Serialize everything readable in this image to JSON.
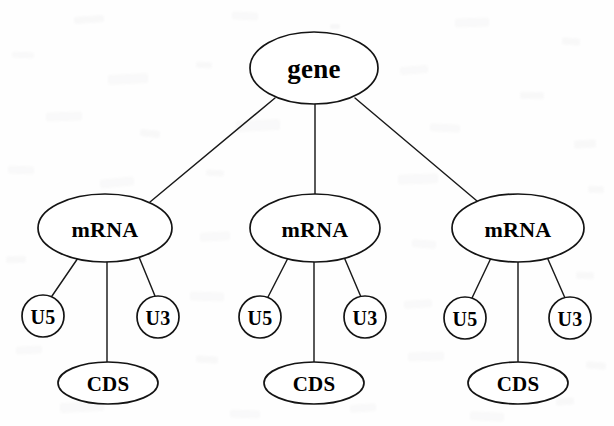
{
  "diagram": {
    "type": "tree",
    "background_color": "#fefefe",
    "stroke_color": "#141414",
    "text_color": "#000000",
    "root": {
      "id": "gene",
      "label": "gene",
      "shape": "ellipse",
      "cx": 314,
      "cy": 68,
      "rx": 64,
      "ry": 36
    },
    "nodes": [
      {
        "id": "mrna-1",
        "label": "mRNA",
        "shape": "ellipse",
        "cx": 105,
        "cy": 228,
        "rx": 67,
        "ry": 34
      },
      {
        "id": "u5-1",
        "label": "U5",
        "shape": "circle",
        "cx": 43,
        "cy": 316,
        "rx": 21,
        "ry": 21
      },
      {
        "id": "u3-1",
        "label": "U3",
        "shape": "circle",
        "cx": 158,
        "cy": 317,
        "rx": 21,
        "ry": 21
      },
      {
        "id": "cds-1",
        "label": "CDS",
        "shape": "ellipse",
        "cx": 108,
        "cy": 383,
        "rx": 50,
        "ry": 21
      },
      {
        "id": "mrna-2",
        "label": "mRNA",
        "shape": "ellipse",
        "cx": 315,
        "cy": 228,
        "rx": 65,
        "ry": 34
      },
      {
        "id": "u5-2",
        "label": "U5",
        "shape": "circle",
        "cx": 260,
        "cy": 317,
        "rx": 21,
        "ry": 21
      },
      {
        "id": "u3-2",
        "label": "U3",
        "shape": "circle",
        "cx": 365,
        "cy": 317,
        "rx": 21,
        "ry": 21
      },
      {
        "id": "cds-2",
        "label": "CDS",
        "shape": "ellipse",
        "cx": 314,
        "cy": 383,
        "rx": 50,
        "ry": 21
      },
      {
        "id": "mrna-3",
        "label": "mRNA",
        "shape": "ellipse",
        "cx": 518,
        "cy": 228,
        "rx": 66,
        "ry": 34
      },
      {
        "id": "u5-3",
        "label": "U5",
        "shape": "circle",
        "cx": 465,
        "cy": 318,
        "rx": 21,
        "ry": 21
      },
      {
        "id": "u3-3",
        "label": "U3",
        "shape": "circle",
        "cx": 570,
        "cy": 318,
        "rx": 21,
        "ry": 21
      },
      {
        "id": "cds-3",
        "label": "CDS",
        "shape": "ellipse",
        "cx": 518,
        "cy": 383,
        "rx": 50,
        "ry": 21
      }
    ],
    "edges": [
      {
        "id": "edge-gene-mrna-1",
        "from": "gene",
        "to": "mrna-1",
        "x1": 275,
        "y1": 98,
        "x2": 150,
        "y2": 202
      },
      {
        "id": "edge-gene-mrna-2",
        "from": "gene",
        "to": "mrna-2",
        "x1": 315,
        "y1": 104,
        "x2": 315,
        "y2": 194
      },
      {
        "id": "edge-gene-mrna-3",
        "from": "gene",
        "to": "mrna-3",
        "x1": 355,
        "y1": 98,
        "x2": 477,
        "y2": 201
      },
      {
        "id": "edge-mrna-1-u5",
        "from": "mrna-1",
        "to": "u5-1",
        "x1": 78,
        "y1": 258,
        "x2": 52,
        "y2": 296
      },
      {
        "id": "edge-mrna-1-cds",
        "from": "mrna-1",
        "to": "cds-1",
        "x1": 107,
        "y1": 262,
        "x2": 107,
        "y2": 362
      },
      {
        "id": "edge-mrna-1-u3",
        "from": "mrna-1",
        "to": "u3-1",
        "x1": 139,
        "y1": 257,
        "x2": 155,
        "y2": 296
      },
      {
        "id": "edge-mrna-2-u5",
        "from": "mrna-2",
        "to": "u5-2",
        "x1": 288,
        "y1": 258,
        "x2": 268,
        "y2": 297
      },
      {
        "id": "edge-mrna-2-cds",
        "from": "mrna-2",
        "to": "cds-2",
        "x1": 314,
        "y1": 262,
        "x2": 314,
        "y2": 362
      },
      {
        "id": "edge-mrna-2-u3",
        "from": "mrna-2",
        "to": "u3-2",
        "x1": 344,
        "y1": 257,
        "x2": 361,
        "y2": 297
      },
      {
        "id": "edge-mrna-3-u5",
        "from": "mrna-3",
        "to": "u5-3",
        "x1": 491,
        "y1": 258,
        "x2": 472,
        "y2": 298
      },
      {
        "id": "edge-mrna-3-cds",
        "from": "mrna-3",
        "to": "cds-3",
        "x1": 518,
        "y1": 262,
        "x2": 518,
        "y2": 362
      },
      {
        "id": "edge-mrna-3-u3",
        "from": "mrna-3",
        "to": "u3-3",
        "x1": 547,
        "y1": 257,
        "x2": 565,
        "y2": 298
      }
    ],
    "speckles": [
      {
        "x": 74,
        "y": 16,
        "w": 30,
        "h": 7,
        "o": 0.07,
        "r": -4
      },
      {
        "x": 232,
        "y": 12,
        "w": 26,
        "h": 8,
        "o": 0.06,
        "r": 3
      },
      {
        "x": 330,
        "y": 24,
        "w": 10,
        "h": 5,
        "o": 0.09,
        "r": 0
      },
      {
        "x": 455,
        "y": 18,
        "w": 34,
        "h": 9,
        "o": 0.06,
        "r": -2
      },
      {
        "x": 562,
        "y": 38,
        "w": 18,
        "h": 7,
        "o": 0.07,
        "r": 5
      },
      {
        "x": 12,
        "y": 52,
        "w": 22,
        "h": 6,
        "o": 0.06,
        "r": 2
      },
      {
        "x": 108,
        "y": 74,
        "w": 40,
        "h": 10,
        "o": 0.06,
        "r": -3
      },
      {
        "x": 196,
        "y": 62,
        "w": 16,
        "h": 6,
        "o": 0.07,
        "r": 4
      },
      {
        "x": 400,
        "y": 66,
        "w": 28,
        "h": 8,
        "o": 0.06,
        "r": -5
      },
      {
        "x": 520,
        "y": 92,
        "w": 24,
        "h": 7,
        "o": 0.07,
        "r": 2
      },
      {
        "x": 46,
        "y": 112,
        "w": 36,
        "h": 9,
        "o": 0.06,
        "r": -2
      },
      {
        "x": 140,
        "y": 130,
        "w": 20,
        "h": 7,
        "o": 0.07,
        "r": 6
      },
      {
        "x": 236,
        "y": 120,
        "w": 44,
        "h": 11,
        "o": 0.06,
        "r": -3
      },
      {
        "x": 430,
        "y": 124,
        "w": 30,
        "h": 8,
        "o": 0.06,
        "r": 3
      },
      {
        "x": 574,
        "y": 140,
        "w": 22,
        "h": 8,
        "o": 0.07,
        "r": -4
      },
      {
        "x": 8,
        "y": 166,
        "w": 26,
        "h": 8,
        "o": 0.06,
        "r": 2
      },
      {
        "x": 100,
        "y": 178,
        "w": 34,
        "h": 9,
        "o": 0.06,
        "r": -6
      },
      {
        "x": 206,
        "y": 170,
        "w": 18,
        "h": 6,
        "o": 0.07,
        "r": 4
      },
      {
        "x": 398,
        "y": 174,
        "w": 40,
        "h": 10,
        "o": 0.06,
        "r": -2
      },
      {
        "x": 588,
        "y": 186,
        "w": 16,
        "h": 7,
        "o": 0.07,
        "r": 3
      },
      {
        "x": 200,
        "y": 232,
        "w": 30,
        "h": 9,
        "o": 0.06,
        "r": -3
      },
      {
        "x": 412,
        "y": 240,
        "w": 24,
        "h": 8,
        "o": 0.06,
        "r": 5
      },
      {
        "x": 6,
        "y": 256,
        "w": 20,
        "h": 7,
        "o": 0.07,
        "r": -2
      },
      {
        "x": 190,
        "y": 292,
        "w": 34,
        "h": 9,
        "o": 0.06,
        "r": 2
      },
      {
        "x": 404,
        "y": 300,
        "w": 28,
        "h": 8,
        "o": 0.06,
        "r": -4
      },
      {
        "x": 576,
        "y": 272,
        "w": 18,
        "h": 7,
        "o": 0.07,
        "r": 3
      },
      {
        "x": 16,
        "y": 346,
        "w": 26,
        "h": 8,
        "o": 0.06,
        "r": -3
      },
      {
        "x": 196,
        "y": 356,
        "w": 22,
        "h": 7,
        "o": 0.07,
        "r": 4
      },
      {
        "x": 408,
        "y": 352,
        "w": 36,
        "h": 9,
        "o": 0.06,
        "r": -2
      },
      {
        "x": 586,
        "y": 362,
        "w": 20,
        "h": 7,
        "o": 0.07,
        "r": 5
      },
      {
        "x": 60,
        "y": 402,
        "w": 44,
        "h": 10,
        "o": 0.06,
        "r": -3
      },
      {
        "x": 230,
        "y": 410,
        "w": 30,
        "h": 8,
        "o": 0.06,
        "r": 2
      },
      {
        "x": 350,
        "y": 404,
        "w": 26,
        "h": 8,
        "o": 0.06,
        "r": -4
      },
      {
        "x": 470,
        "y": 412,
        "w": 34,
        "h": 9,
        "o": 0.06,
        "r": 3
      },
      {
        "x": 556,
        "y": 398,
        "w": 18,
        "h": 7,
        "o": 0.07,
        "r": -5
      }
    ]
  }
}
